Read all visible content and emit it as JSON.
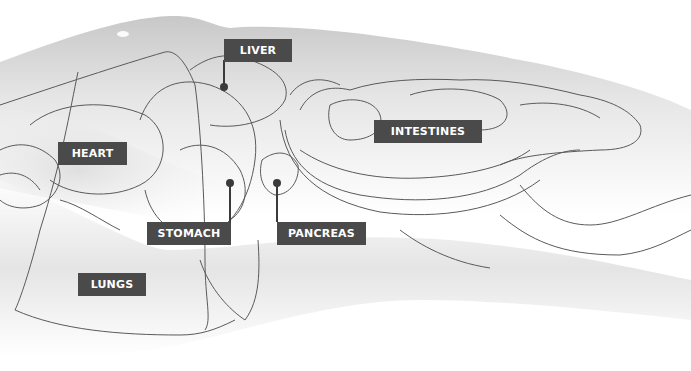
{
  "diagram": {
    "type": "anatomical illustration",
    "colors": {
      "label_bg": "#4a4a4a",
      "label_text": "#ffffff",
      "outline": "#5a5a5a",
      "body_shade": "#d9d9d9"
    },
    "labels": [
      {
        "id": "liver",
        "text": "LIVER"
      },
      {
        "id": "heart",
        "text": "HEART"
      },
      {
        "id": "intestines",
        "text": "INTESTINES"
      },
      {
        "id": "stomach",
        "text": "STOMACH"
      },
      {
        "id": "pancreas",
        "text": "PANCREAS"
      },
      {
        "id": "lungs",
        "text": "LUNGS"
      }
    ]
  }
}
